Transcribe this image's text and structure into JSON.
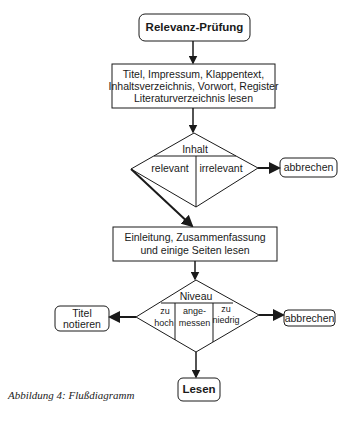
{
  "diagram": {
    "type": "flowchart",
    "start": {
      "label": "Relevanz-Prüfung"
    },
    "step1": {
      "lines": [
        "Titel, Impressum, Klappentext,",
        "Inhaltsverzeichnis, Vorwort, Register",
        "Literaturverzeichnis lesen"
      ]
    },
    "decision1": {
      "title": "Inhalt",
      "options": [
        "relevant",
        "irrelevant"
      ],
      "exit_label": "abbrechen"
    },
    "step2": {
      "lines": [
        "Einleitung, Zusammenfassung",
        "und einige Seiten lesen"
      ]
    },
    "decision2": {
      "title": "Niveau",
      "options": [
        {
          "line1": "zu",
          "line2": "hoch"
        },
        {
          "line1": "ange-",
          "line2": "messen"
        },
        {
          "line1": "zu",
          "line2": "niedrig"
        }
      ],
      "left_exit": {
        "line1": "Titel",
        "line2": "notieren"
      },
      "right_exit": "abbrechen"
    },
    "end": {
      "label": "Lesen"
    },
    "caption": "Abbildung 4: Flußdiagramm",
    "colors": {
      "stroke": "#1a1a1a",
      "background": "#ffffff"
    }
  }
}
